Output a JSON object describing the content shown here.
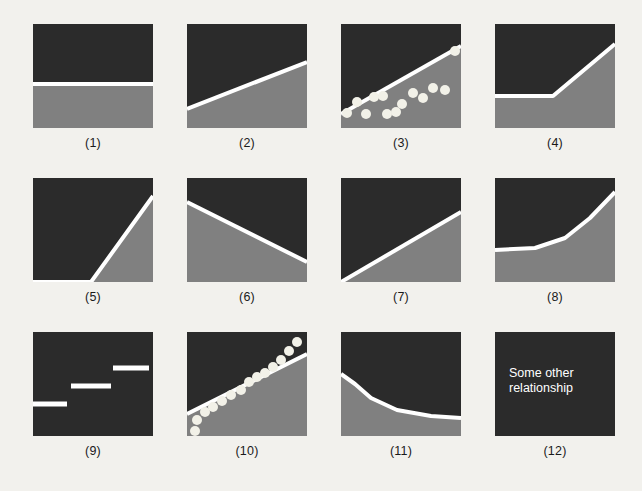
{
  "figure": {
    "background_color": "#f2f1ed",
    "dark_color": "#2b2b2b",
    "light_color": "#808080",
    "line_color": "#ffffff",
    "panel_width": 120,
    "panel_height": 104,
    "columns_x": [
      33,
      187,
      341,
      495
    ],
    "rows_y": [
      24,
      178,
      332
    ]
  },
  "chart_data": {
    "type": "diagram",
    "title": "",
    "panels": [
      {
        "id": 1,
        "caption": "(1)",
        "shape": "horizontal-flat-line",
        "note": "No relationship: flat horizontal line across the middle",
        "boundary_points": [
          [
            0,
            60
          ],
          [
            120,
            60
          ]
        ]
      },
      {
        "id": 2,
        "caption": "(2)",
        "shape": "gentle-positive-linear",
        "note": "Shallow positive straight line rising left to right",
        "boundary_points": [
          [
            0,
            85
          ],
          [
            120,
            38
          ]
        ]
      },
      {
        "id": 3,
        "caption": "(3)",
        "shape": "positive-linear-with-scatter",
        "note": "Positive straight line with scattered data points around it",
        "boundary_points": [
          [
            0,
            90
          ],
          [
            120,
            22
          ]
        ],
        "scatter_points": [
          [
            6,
            89
          ],
          [
            16,
            78
          ],
          [
            25,
            90
          ],
          [
            33,
            73
          ],
          [
            42,
            72
          ],
          [
            46,
            90
          ],
          [
            55,
            88
          ],
          [
            61,
            80
          ],
          [
            72,
            69
          ],
          [
            82,
            74
          ],
          [
            92,
            64
          ],
          [
            104,
            66
          ],
          [
            114,
            27
          ]
        ]
      },
      {
        "id": 4,
        "caption": "(4)",
        "shape": "flat-then-rising",
        "note": "Flat until a threshold then rises steeply (hockey stick)",
        "boundary_points": [
          [
            0,
            72
          ],
          [
            58,
            72
          ],
          [
            120,
            20
          ]
        ]
      },
      {
        "id": 5,
        "caption": "(5)",
        "shape": "flat-then-steep-rise-late",
        "note": "Flat along bottom then very steep rise near right edge",
        "boundary_points": [
          [
            0,
            104
          ],
          [
            58,
            104
          ],
          [
            120,
            18
          ]
        ]
      },
      {
        "id": 6,
        "caption": "(6)",
        "shape": "negative-linear",
        "note": "Negative straight line falling left to right",
        "boundary_points": [
          [
            0,
            24
          ],
          [
            120,
            84
          ]
        ]
      },
      {
        "id": 7,
        "caption": "(7)",
        "shape": "steeper-positive-linear",
        "note": "Positive straight line from bottom-left corner to right edge",
        "boundary_points": [
          [
            0,
            104
          ],
          [
            120,
            34
          ]
        ]
      },
      {
        "id": 8,
        "caption": "(8)",
        "shape": "exponential-increase",
        "note": "Flat at low level then accelerating upward (convex increasing)",
        "boundary_points": [
          [
            0,
            72
          ],
          [
            40,
            70
          ],
          [
            70,
            60
          ],
          [
            95,
            40
          ],
          [
            120,
            14
          ]
        ]
      },
      {
        "id": 9,
        "caption": "(9)",
        "shape": "step-function",
        "note": "Three discrete flat step segments rising left to right",
        "segments": [
          {
            "x1": 0,
            "x2": 34,
            "y": 72
          },
          {
            "x1": 38,
            "x2": 78,
            "y": 54
          },
          {
            "x1": 80,
            "x2": 116,
            "y": 36
          }
        ]
      },
      {
        "id": 10,
        "caption": "(10)",
        "shape": "linear-fit-to-curved-data",
        "note": "Straight line fitted to data points that actually follow a curve",
        "boundary_points": [
          [
            0,
            82
          ],
          [
            120,
            22
          ]
        ],
        "scatter_points": [
          [
            8,
            99
          ],
          [
            10,
            88
          ],
          [
            18,
            80
          ],
          [
            26,
            75
          ],
          [
            35,
            69
          ],
          [
            44,
            63
          ],
          [
            54,
            58
          ],
          [
            62,
            50
          ],
          [
            70,
            45
          ],
          [
            78,
            41
          ],
          [
            86,
            35
          ],
          [
            94,
            28
          ],
          [
            102,
            19
          ],
          [
            110,
            10
          ]
        ]
      },
      {
        "id": 11,
        "caption": "(11)",
        "shape": "decay-curve",
        "note": "Steep drop then flattening out (convex decreasing / decay)",
        "boundary_points": [
          [
            0,
            42
          ],
          [
            14,
            52
          ],
          [
            30,
            66
          ],
          [
            56,
            78
          ],
          [
            90,
            84
          ],
          [
            120,
            86
          ]
        ]
      },
      {
        "id": 12,
        "caption": "(12)",
        "shape": "text-only",
        "note": "Placeholder panel containing text instead of a curve",
        "text": "Some other relationship"
      }
    ]
  }
}
